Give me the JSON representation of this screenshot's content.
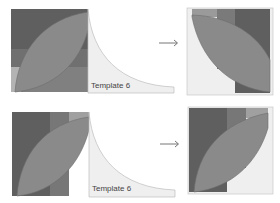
{
  "colors": {
    "background": "#ffffff",
    "dark": "#5f5f5f",
    "medium": "#7a7a7a",
    "light": "#9a9a9a",
    "pale": "#b9b9b9",
    "petal": "#8a8a8a",
    "template_fill": "#efefef",
    "template_stroke": "#bdbdbd",
    "arrow": "#666666"
  },
  "rows": [
    {
      "template_label": "Template 6",
      "arrow": "→"
    },
    {
      "template_label": "Template 6",
      "arrow": "→"
    }
  ]
}
